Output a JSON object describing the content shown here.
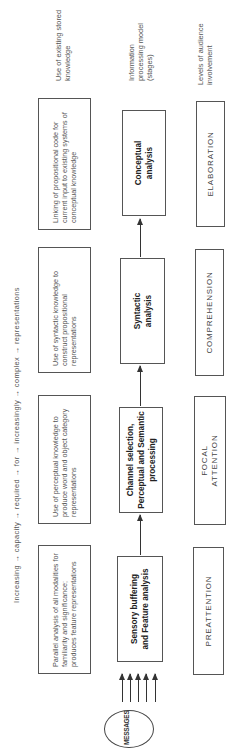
{
  "axis": {
    "text": "Increasing → capacity → required → for → increasingly → complex → representations"
  },
  "row_labels": {
    "knowledge": "Use of existing stored knowledge",
    "stages": "Information processing model (stages)",
    "involvement": "Levels of audience involvement"
  },
  "input": {
    "label": "MESSAGES",
    "letters": [
      "M",
      "E",
      "S",
      "S",
      "A",
      "G",
      "E",
      "S"
    ]
  },
  "columns": [
    {
      "knowledge": "Parallel analysis of all modalities for familiarity and significance; produces feature representations",
      "stage": "Sensory buffering and Feature analysis",
      "level": "PREATTENTION"
    },
    {
      "knowledge": "Use of perceptual knowledge to produce word and object category representations",
      "stage": "Channel selection, Perceptual and Semantic processing",
      "level": "FOCAL ATTENTION"
    },
    {
      "knowledge": "Use of syntactic knowledge to construct propositional representations",
      "stage": "Syntactic analysis",
      "level": "COMPREHENSION"
    },
    {
      "knowledge": "Linking of propositional code for current input to existing systems of conceptual knowledge",
      "stage": "Conceptual analysis",
      "level": "ELABORATION"
    }
  ]
}
